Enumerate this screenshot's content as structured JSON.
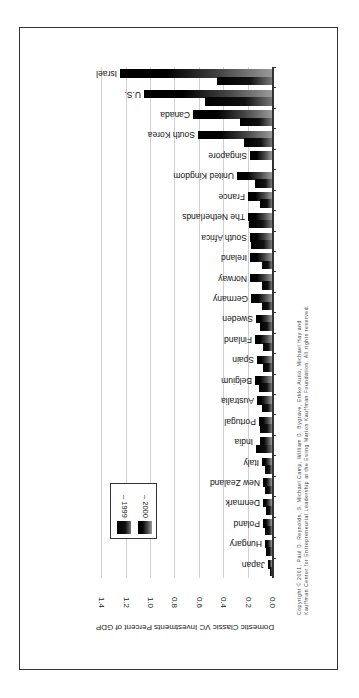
{
  "chart_data": {
    "type": "bar",
    "orientation": "horizontal (image rotated)",
    "title": "",
    "ylabel": "Domestic Classic VC Investments Percent of GDP",
    "xlabel": "",
    "ylim": [
      0.0,
      1.4
    ],
    "ticks": [
      "0.0",
      "0.2",
      "0.4",
      "0.6",
      "0.8",
      "1.0",
      "1.2",
      "1.4"
    ],
    "grid": true,
    "legend_position": "inside, near bottom-left",
    "categories": [
      "Israel",
      "U.S.",
      "Canada",
      "South Korea",
      "Singapore",
      "United Kingdom",
      "France",
      "The Netherlands",
      "South Africa",
      "Ireland",
      "Norway",
      "Germany",
      "Sweden",
      "Finland",
      "Spain",
      "Belgium",
      "Australia",
      "Portugal",
      "India",
      "Italy",
      "New Zealand",
      "Denmark",
      "Poland",
      "Hungary",
      "Japan"
    ],
    "series": [
      {
        "name": "1999",
        "values": [
          0.45,
          0.55,
          0.26,
          0.23,
          0.0,
          0.14,
          0.1,
          0.19,
          0.17,
          0.08,
          0.08,
          0.08,
          0.1,
          0.07,
          0.07,
          0.11,
          0.08,
          0.1,
          0.13,
          0.06,
          0.06,
          0.05,
          0.06,
          0.05,
          0.02
        ]
      },
      {
        "name": "2000",
        "values": [
          1.25,
          1.05,
          0.65,
          0.61,
          0.18,
          0.29,
          0.2,
          0.2,
          0.18,
          0.18,
          0.18,
          0.17,
          0.13,
          0.14,
          0.12,
          0.14,
          0.12,
          0.11,
          0.1,
          0.08,
          0.07,
          0.07,
          0.07,
          0.06,
          0.03
        ]
      }
    ],
    "legend": [
      "1999",
      "2000"
    ],
    "annotations": [
      "Copyright © 2001, Paul D. Reynolds, S. Michael Camp, William D. Bygrave, Erkko Autio, Michael Hay and",
      "Kauffman Center for Entrepreneurial Leadership at the Ewing Marion Kauffman Foundation. All rights reserved."
    ]
  },
  "legend": {
    "items": [
      {
        "label": "– 1999"
      },
      {
        "label": "– 2000"
      }
    ]
  },
  "copyright": {
    "line1": "Copyright © 2001, Paul D. Reynolds, S. Michael Camp, William D. Bygrave, Erkko Autio, Michael Hay and",
    "line2": "Kauffman Center for Entrepreneurial Leadership at the Ewing Marion Kauffman Foundation. All rights reserved."
  }
}
